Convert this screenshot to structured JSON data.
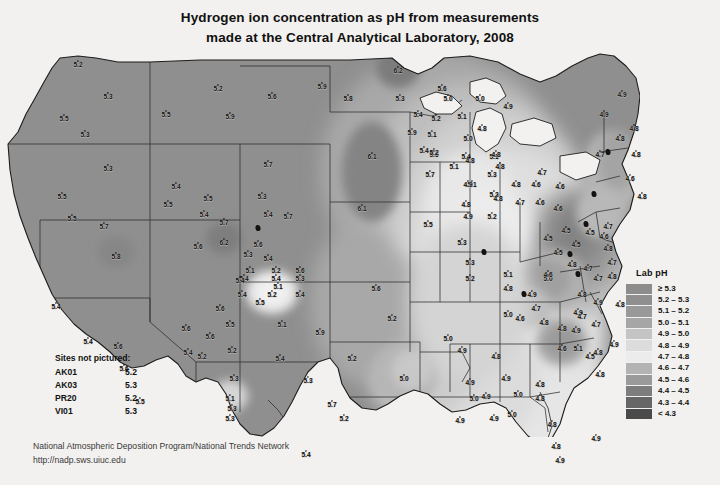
{
  "title": {
    "line1": "Hydrogen ion concentration as pH from measurements",
    "line2": "made at the Central Analytical Laboratory, 2008"
  },
  "legend": {
    "title": "Lab pH",
    "entries": [
      {
        "label": "≥ 5.3",
        "color": "#8c8c8c"
      },
      {
        "label": "5.2 – 5.3",
        "color": "#8f8f8f"
      },
      {
        "label": "5.1 – 5.2",
        "color": "#999999"
      },
      {
        "label": "5.0 – 5.1",
        "color": "#a6a6a6"
      },
      {
        "label": "4.9 – 5.0",
        "color": "#c4c4c4"
      },
      {
        "label": "4.8 – 4.9",
        "color": "#dcdcdc"
      },
      {
        "label": "4.7 – 4.8",
        "color": "#ececec"
      },
      {
        "label": "4.6 – 4.7",
        "color": "#b3b3b3"
      },
      {
        "label": "4.5 – 4.6",
        "color": "#9a9a9a"
      },
      {
        "label": "4.4 – 4.5",
        "color": "#7d7d7d"
      },
      {
        "label": "4.3 – 4.4",
        "color": "#666666"
      },
      {
        "label": "< 4.3",
        "color": "#4a4a4a"
      }
    ]
  },
  "sites_not_pictured": {
    "heading": "Sites not pictured:",
    "rows": [
      {
        "code": "AK01",
        "value": "5.2"
      },
      {
        "code": "AK03",
        "value": "5.3"
      },
      {
        "code": "PR20",
        "value": "5.2"
      },
      {
        "code": "VI01",
        "value": "5.3"
      }
    ]
  },
  "footer": {
    "line1": "National Atmospheric Deposition Program/National Trends Network",
    "line2": "http://nadp.sws.uiuc.edu"
  },
  "chart_data": {
    "type": "map",
    "title": "Hydrogen ion concentration as pH from measurements made at the Central Analytical Laboratory, 2008",
    "variable": "Lab pH",
    "region": "Contiguous United States",
    "value_range": [
      4.3,
      6.2
    ],
    "legend_position": "right",
    "measurements": [
      {
        "label": "5.2",
        "x": 78,
        "y": 8
      },
      {
        "label": "5.3",
        "x": 108,
        "y": 40
      },
      {
        "label": "5.5",
        "x": 64,
        "y": 62
      },
      {
        "label": "5.3",
        "x": 85,
        "y": 78
      },
      {
        "label": "5.3",
        "x": 108,
        "y": 112
      },
      {
        "label": "5.5",
        "x": 62,
        "y": 140
      },
      {
        "label": "5.5",
        "x": 72,
        "y": 162
      },
      {
        "label": "5.8",
        "x": 116,
        "y": 200
      },
      {
        "label": "5.4",
        "x": 56,
        "y": 250
      },
      {
        "label": "5.4",
        "x": 88,
        "y": 285
      },
      {
        "label": "5.6",
        "x": 118,
        "y": 290
      },
      {
        "label": "5.6",
        "x": 124,
        "y": 312
      },
      {
        "label": "5.5",
        "x": 140,
        "y": 345
      },
      {
        "label": "5.4",
        "x": 176,
        "y": 130
      },
      {
        "label": "5.5",
        "x": 166,
        "y": 58
      },
      {
        "label": "5.7",
        "x": 104,
        "y": 170
      },
      {
        "label": "5.2",
        "x": 218,
        "y": 32
      },
      {
        "label": "5.6",
        "x": 272,
        "y": 40
      },
      {
        "label": "5.7",
        "x": 268,
        "y": 108
      },
      {
        "label": "5.3",
        "x": 262,
        "y": 140
      },
      {
        "label": "5.4",
        "x": 268,
        "y": 158
      },
      {
        "label": "5.7",
        "x": 288,
        "y": 160
      },
      {
        "label": "6.2",
        "x": 224,
        "y": 186
      },
      {
        "label": "5.6",
        "x": 258,
        "y": 188
      },
      {
        "label": "5.4",
        "x": 244,
        "y": 222
      },
      {
        "label": "5.4",
        "x": 276,
        "y": 222
      },
      {
        "label": "5.1",
        "x": 278,
        "y": 230
      },
      {
        "label": "5.6",
        "x": 186,
        "y": 272
      },
      {
        "label": "5.4",
        "x": 188,
        "y": 296
      },
      {
        "label": "5.6",
        "x": 220,
        "y": 252
      },
      {
        "label": "5.6",
        "x": 210,
        "y": 280
      },
      {
        "label": "5.3",
        "x": 234,
        "y": 322
      },
      {
        "label": "5.1",
        "x": 230,
        "y": 342
      },
      {
        "label": "5.3",
        "x": 230,
        "y": 362
      },
      {
        "label": "5.5",
        "x": 168,
        "y": 148
      },
      {
        "label": "5.9",
        "x": 230,
        "y": 60
      },
      {
        "label": "5.5",
        "x": 208,
        "y": 142
      },
      {
        "label": "5.4",
        "x": 204,
        "y": 158
      },
      {
        "label": "5.7",
        "x": 224,
        "y": 166
      },
      {
        "label": "5.6",
        "x": 198,
        "y": 190
      },
      {
        "label": "5.3",
        "x": 248,
        "y": 198
      },
      {
        "label": "5.4",
        "x": 268,
        "y": 202
      },
      {
        "label": "5.1",
        "x": 250,
        "y": 214
      },
      {
        "label": "5.2",
        "x": 276,
        "y": 214
      },
      {
        "label": "5.6",
        "x": 300,
        "y": 214
      },
      {
        "label": "5.4",
        "x": 240,
        "y": 224
      },
      {
        "label": "5.3",
        "x": 300,
        "y": 222
      },
      {
        "label": "5.4",
        "x": 242,
        "y": 238
      },
      {
        "label": "5.2",
        "x": 272,
        "y": 238
      },
      {
        "label": "5.5",
        "x": 260,
        "y": 246
      },
      {
        "label": "5.4",
        "x": 300,
        "y": 238
      },
      {
        "label": "5.5",
        "x": 230,
        "y": 268
      },
      {
        "label": "5.1",
        "x": 282,
        "y": 268
      },
      {
        "label": "5.9",
        "x": 320,
        "y": 276
      },
      {
        "label": "5.2",
        "x": 232,
        "y": 294
      },
      {
        "label": "5.4",
        "x": 280,
        "y": 302
      },
      {
        "label": "5.2",
        "x": 202,
        "y": 300
      },
      {
        "label": "5.3",
        "x": 308,
        "y": 324
      },
      {
        "label": "5.3",
        "x": 232,
        "y": 352
      },
      {
        "label": "5.7",
        "x": 332,
        "y": 348
      },
      {
        "label": "5.9",
        "x": 322,
        "y": 30
      },
      {
        "label": "5.8",
        "x": 348,
        "y": 42
      },
      {
        "label": "6.2",
        "x": 398,
        "y": 14
      },
      {
        "label": "5.6",
        "x": 442,
        "y": 32
      },
      {
        "label": "6.1",
        "x": 372,
        "y": 100
      },
      {
        "label": "5.6",
        "x": 434,
        "y": 98
      },
      {
        "label": "6.1",
        "x": 362,
        "y": 152
      },
      {
        "label": "5.5",
        "x": 428,
        "y": 168
      },
      {
        "label": "5.3",
        "x": 462,
        "y": 186
      },
      {
        "label": "5.6",
        "x": 376,
        "y": 232
      },
      {
        "label": "5.2",
        "x": 470,
        "y": 222
      },
      {
        "label": "5.2",
        "x": 352,
        "y": 302
      },
      {
        "label": "5.2",
        "x": 392,
        "y": 262
      },
      {
        "label": "5.0",
        "x": 448,
        "y": 282
      },
      {
        "label": "5.0",
        "x": 404,
        "y": 322
      },
      {
        "label": "5.2",
        "x": 344,
        "y": 362
      },
      {
        "label": "5.4",
        "x": 306,
        "y": 398
      },
      {
        "label": "5.3",
        "x": 470,
        "y": 206
      },
      {
        "label": "5.1",
        "x": 508,
        "y": 218
      },
      {
        "label": "5.0",
        "x": 548,
        "y": 222
      },
      {
        "label": "4.9",
        "x": 578,
        "y": 256
      },
      {
        "label": "5.3",
        "x": 400,
        "y": 42
      },
      {
        "label": "5.4",
        "x": 418,
        "y": 58
      },
      {
        "label": "5.9",
        "x": 412,
        "y": 76
      },
      {
        "label": "5.4",
        "x": 424,
        "y": 94
      },
      {
        "label": "5.7",
        "x": 430,
        "y": 118
      },
      {
        "label": "5.4",
        "x": 466,
        "y": 100
      },
      {
        "label": "5.1",
        "x": 494,
        "y": 100
      },
      {
        "label": "5.3",
        "x": 492,
        "y": 118
      },
      {
        "label": "5.2",
        "x": 494,
        "y": 138
      },
      {
        "label": "5.2",
        "x": 492,
        "y": 160
      },
      {
        "label": "5.0",
        "x": 448,
        "y": 42
      },
      {
        "label": "5.0",
        "x": 480,
        "y": 42
      },
      {
        "label": "4.9",
        "x": 508,
        "y": 50
      },
      {
        "label": "5.2",
        "x": 436,
        "y": 62
      },
      {
        "label": "5.1",
        "x": 462,
        "y": 60
      },
      {
        "label": "5.1",
        "x": 432,
        "y": 78
      },
      {
        "label": "5.0",
        "x": 468,
        "y": 82
      },
      {
        "label": "5.2",
        "x": 434,
        "y": 96
      },
      {
        "label": "5.1",
        "x": 454,
        "y": 110
      },
      {
        "label": "5.1",
        "x": 472,
        "y": 128
      },
      {
        "label": "4.8",
        "x": 482,
        "y": 72
      },
      {
        "label": "4.8",
        "x": 496,
        "y": 98
      },
      {
        "label": "4.8",
        "x": 470,
        "y": 104
      },
      {
        "label": "4.9",
        "x": 468,
        "y": 128
      },
      {
        "label": "4.8",
        "x": 500,
        "y": 110
      },
      {
        "label": "4.8",
        "x": 466,
        "y": 148
      },
      {
        "label": "4.9",
        "x": 468,
        "y": 160
      },
      {
        "label": "4.8",
        "x": 516,
        "y": 128
      },
      {
        "label": "4.8",
        "x": 498,
        "y": 142
      },
      {
        "label": "4.7",
        "x": 520,
        "y": 146
      },
      {
        "label": "4.6",
        "x": 536,
        "y": 128
      },
      {
        "label": "4.7",
        "x": 542,
        "y": 116
      },
      {
        "label": "4.6",
        "x": 540,
        "y": 146
      },
      {
        "label": "4.6",
        "x": 560,
        "y": 130
      },
      {
        "label": "4.6",
        "x": 558,
        "y": 152
      },
      {
        "label": "4.5",
        "x": 566,
        "y": 174
      },
      {
        "label": "4.5",
        "x": 548,
        "y": 182
      },
      {
        "label": "4.5",
        "x": 558,
        "y": 196
      },
      {
        "label": "4.5",
        "x": 576,
        "y": 188
      },
      {
        "label": "4.5",
        "x": 590,
        "y": 176
      },
      {
        "label": "4.6",
        "x": 604,
        "y": 180
      },
      {
        "label": "4.8",
        "x": 608,
        "y": 192
      },
      {
        "label": "4.7",
        "x": 612,
        "y": 206
      },
      {
        "label": "4.8",
        "x": 612,
        "y": 220
      },
      {
        "label": "4.7",
        "x": 588,
        "y": 212
      },
      {
        "label": "4.7",
        "x": 598,
        "y": 222
      },
      {
        "label": "4.8",
        "x": 572,
        "y": 208
      },
      {
        "label": "4.8",
        "x": 582,
        "y": 238
      },
      {
        "label": "4.9",
        "x": 598,
        "y": 246
      },
      {
        "label": "4.8",
        "x": 620,
        "y": 248
      },
      {
        "label": "4.6",
        "x": 548,
        "y": 218
      },
      {
        "label": "4.9",
        "x": 532,
        "y": 238
      },
      {
        "label": "5.0",
        "x": 508,
        "y": 258
      },
      {
        "label": "4.8",
        "x": 508,
        "y": 232
      },
      {
        "label": "4.6",
        "x": 520,
        "y": 262
      },
      {
        "label": "4.7",
        "x": 536,
        "y": 252
      },
      {
        "label": "4.8",
        "x": 544,
        "y": 266
      },
      {
        "label": "4.8",
        "x": 562,
        "y": 272
      },
      {
        "label": "4.7",
        "x": 582,
        "y": 260
      },
      {
        "label": "4.9",
        "x": 576,
        "y": 274
      },
      {
        "label": "4.7",
        "x": 596,
        "y": 268
      },
      {
        "label": "4.9",
        "x": 614,
        "y": 288
      },
      {
        "label": "4.8",
        "x": 598,
        "y": 296
      },
      {
        "label": "5.1",
        "x": 578,
        "y": 292
      },
      {
        "label": "4.6",
        "x": 562,
        "y": 292
      },
      {
        "label": "4.5",
        "x": 590,
        "y": 300
      },
      {
        "label": "4.8",
        "x": 600,
        "y": 318
      },
      {
        "label": "4.9",
        "x": 462,
        "y": 294
      },
      {
        "label": "4.8",
        "x": 496,
        "y": 300
      },
      {
        "label": "4.9",
        "x": 506,
        "y": 322
      },
      {
        "label": "4.9",
        "x": 470,
        "y": 326
      },
      {
        "label": "5.0",
        "x": 474,
        "y": 342
      },
      {
        "label": "4.9",
        "x": 486,
        "y": 340
      },
      {
        "label": "5.0",
        "x": 518,
        "y": 338
      },
      {
        "label": "4.8",
        "x": 540,
        "y": 328
      },
      {
        "label": "4.8",
        "x": 540,
        "y": 342
      },
      {
        "label": "5.0",
        "x": 512,
        "y": 358
      },
      {
        "label": "4.9",
        "x": 460,
        "y": 364
      },
      {
        "label": "4.9",
        "x": 494,
        "y": 362
      },
      {
        "label": "4.8",
        "x": 552,
        "y": 368
      },
      {
        "label": "4.8",
        "x": 556,
        "y": 390
      },
      {
        "label": "4.9",
        "x": 560,
        "y": 404
      },
      {
        "label": "4.9",
        "x": 596,
        "y": 382
      },
      {
        "label": "4.9",
        "x": 604,
        "y": 58
      },
      {
        "label": "4.9",
        "x": 622,
        "y": 38
      },
      {
        "label": "4.8",
        "x": 620,
        "y": 82
      },
      {
        "label": "4.8",
        "x": 634,
        "y": 72
      },
      {
        "label": "4.7",
        "x": 600,
        "y": 98
      },
      {
        "label": "4.8",
        "x": 636,
        "y": 98
      },
      {
        "label": "4.6",
        "x": 630,
        "y": 122
      },
      {
        "label": "4.8",
        "x": 642,
        "y": 140
      },
      {
        "label": "4.7",
        "x": 608,
        "y": 170
      }
    ]
  }
}
